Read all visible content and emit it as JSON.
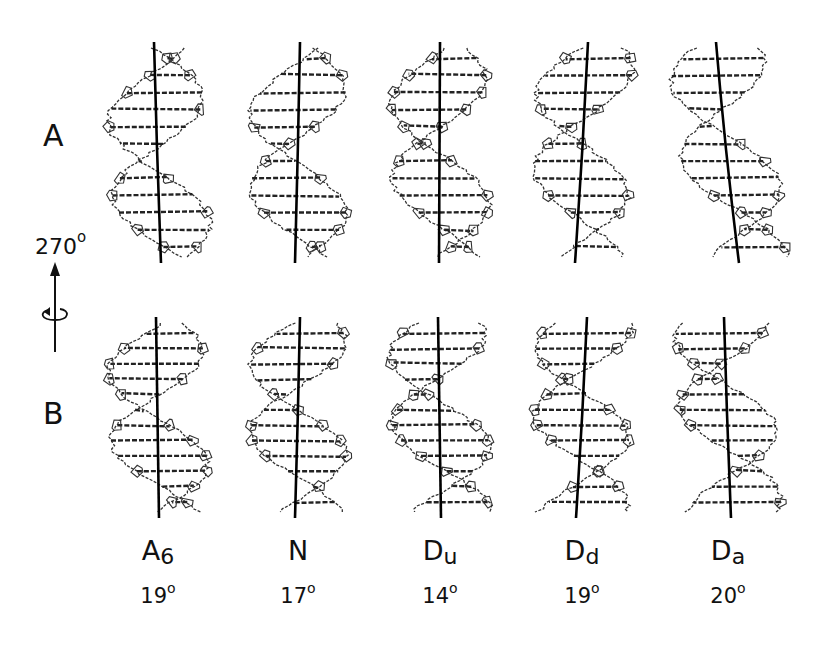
{
  "rows": [
    {
      "label": "A",
      "top": 122
    },
    {
      "label": "B",
      "top": 396
    }
  ],
  "rotation": {
    "value": "270",
    "unit": "o"
  },
  "columns": [
    {
      "name_main": "A",
      "name_sub": "6",
      "angle": "19",
      "unit": "o",
      "cx": 158
    },
    {
      "name_main": "N",
      "name_sub": "",
      "angle": "17",
      "unit": "o",
      "cx": 298
    },
    {
      "name_main": "D",
      "name_sub": "u",
      "angle": "14",
      "unit": "o",
      "cx": 440
    },
    {
      "name_main": "D",
      "name_sub": "d",
      "angle": "19",
      "unit": "o",
      "cx": 582
    },
    {
      "name_main": "D",
      "name_sub": "a",
      "angle": "20",
      "unit": "o",
      "cx": 728
    }
  ],
  "colors": {
    "ink": "#111111",
    "structure": "#333333"
  }
}
